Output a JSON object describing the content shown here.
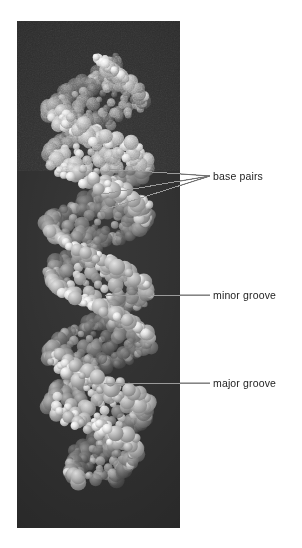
{
  "figure": {
    "kind": "dna-space-filling-model",
    "panel": {
      "x": 17,
      "y": 21,
      "width": 163,
      "height": 507,
      "background_color": "#2f2f2f"
    }
  },
  "colors": {
    "panel_background": "#2f2f2f",
    "atom_dark": "#6f6f6f",
    "atom_mid": "#8d8d8d",
    "atom_light": "#b9b9b9",
    "atom_white": "#ececec",
    "leader_line": "#9a9a9a",
    "leader_line_dark": "#6e6e6e",
    "label_text": "#232323",
    "page_background": "#ffffff"
  },
  "annotations": [
    {
      "id": "base-pairs",
      "label": "base pairs",
      "label_x": 213,
      "label_y": 170,
      "leader_kind": "fan",
      "anchor_x": 210,
      "anchor_y": 176,
      "targets": [
        {
          "x": 109,
          "y": 169
        },
        {
          "x": 103,
          "y": 194
        },
        {
          "x": 100,
          "y": 211
        }
      ]
    },
    {
      "id": "minor-groove",
      "label": "minor groove",
      "label_x": 213,
      "label_y": 289,
      "leader_kind": "straight",
      "anchor_x": 210,
      "anchor_y": 295,
      "targets": [
        {
          "x": 105,
          "y": 295
        }
      ]
    },
    {
      "id": "major-groove",
      "label": "major groove",
      "label_x": 213,
      "label_y": 377,
      "leader_kind": "straight",
      "anchor_x": 210,
      "anchor_y": 383,
      "targets": [
        {
          "x": 104,
          "y": 383
        }
      ]
    }
  ],
  "helix": {
    "turns": 3.4,
    "rise_px": 118,
    "radius_px": 47,
    "center_x": 82,
    "top_y": 62,
    "bottom_y": 478,
    "strand_count": 2,
    "strand_phase_offset_deg": 140,
    "atoms_per_turn_per_strand": 26,
    "sphere_radius_range": [
      3.2,
      8.5
    ]
  }
}
